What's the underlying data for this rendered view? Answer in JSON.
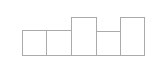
{
  "diagram": {
    "baseline_y": 56,
    "stroke_color": "#aaaaaa",
    "fill_color": "#ffffff",
    "boxes": [
      {
        "x": 22,
        "top": 30,
        "width": 25
      },
      {
        "x": 46,
        "top": 30,
        "width": 26
      },
      {
        "x": 71,
        "top": 17,
        "width": 26
      },
      {
        "x": 96,
        "top": 31,
        "width": 25
      },
      {
        "x": 120,
        "top": 17,
        "width": 25
      }
    ]
  }
}
